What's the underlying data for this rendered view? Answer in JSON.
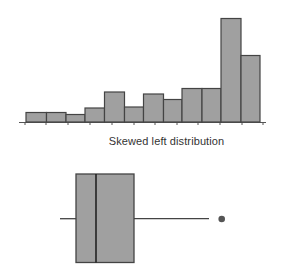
{
  "chart_data": [
    {
      "type": "bar",
      "subtype": "histogram",
      "title": "",
      "xlabel": "",
      "ylabel": "",
      "bins": 12,
      "values": [
        9.5,
        9.5,
        7.5,
        14,
        30,
        15,
        28,
        22.5,
        33.5,
        33.5,
        103.5,
        66.5
      ],
      "relative_heights_note": "pixel heights; no axis labels shown",
      "bar_color": "#a0a0a0",
      "edge_color": "#444444",
      "grid": false,
      "tick_count": 12
    },
    {
      "type": "boxplot",
      "title": "Skewed left distribution",
      "orientation": "horizontal",
      "whisker_low": 60,
      "q1": 76,
      "median": 96,
      "q3": 134,
      "whisker_high": 209,
      "outliers": [
        221.5
      ],
      "units_note": "pixel positions; no numeric axis shown",
      "box_color": "#a0a0a0",
      "edge_color": "#444444"
    }
  ],
  "caption": "Skewed left distribution",
  "histogram": {
    "baseline_y": 122,
    "edges": [
      26,
      46.5,
      66,
      85,
      104.5,
      124.5,
      143.5,
      163.5,
      182,
      202,
      221,
      241,
      260
    ],
    "heights": [
      9.5,
      9.5,
      7.5,
      14,
      30,
      15,
      28,
      22.5,
      33.5,
      33.5,
      103.5,
      66.5
    ],
    "ticks": [
      25,
      46,
      68,
      90,
      112,
      134,
      155,
      177,
      198,
      220,
      242,
      263
    ],
    "axis_x0": 19,
    "axis_x1": 266
  },
  "boxplot": {
    "box_top": 174,
    "box_bottom": 262.5,
    "q1_x": 76,
    "median_x": 96,
    "q3_x": 134,
    "whisker_y": 218.7,
    "whisker_low_x": 60,
    "whisker_high_x": 209,
    "outlier_x": 221.7,
    "outlier_y": 219,
    "outlier_r": 3.3
  },
  "colors": {
    "fill": "#a0a0a0",
    "stroke": "#444444",
    "axis": "#555555",
    "text": "#333333"
  }
}
